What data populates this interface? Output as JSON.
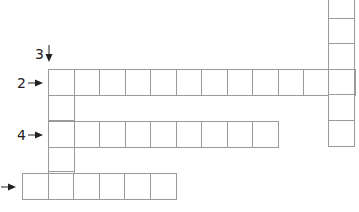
{
  "puzzle": {
    "type": "crossword",
    "cell_size": 25.5,
    "border_color": "#9a9a9a",
    "clues": [
      {
        "number": "2",
        "direction": "across",
        "row_label": "2"
      },
      {
        "number": "3",
        "direction": "down",
        "row_label": "3"
      },
      {
        "number": "4",
        "direction": "across",
        "row_label": "4"
      },
      {
        "number": "",
        "direction": "across",
        "row_label": ""
      }
    ],
    "words": [
      {
        "id": "word-2-across",
        "x": 48,
        "y": 69,
        "dir": "across",
        "length": 12
      },
      {
        "id": "word-3-down",
        "x": 48,
        "y": 69,
        "dir": "down",
        "length": 5
      },
      {
        "id": "word-4-across",
        "x": 48,
        "y": 121,
        "dir": "across",
        "length": 9
      },
      {
        "id": "word-bottom-across",
        "x": 22,
        "y": 173,
        "dir": "across",
        "length": 6
      },
      {
        "id": "word-right-down",
        "x": 328,
        "y": -8,
        "dir": "down",
        "length": 6
      }
    ]
  }
}
